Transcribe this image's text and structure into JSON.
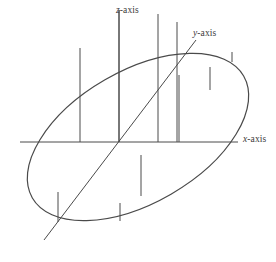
{
  "figure": {
    "kind": "3d-axes-ellipse-diagram",
    "width": 276,
    "height": 262,
    "background_color": "#ffffff",
    "stroke_color": "#4a4a4a",
    "stroke_color_dark": "#3f3f3f",
    "stroke_width": 1.0,
    "ellipse_stroke_width": 1.2
  },
  "labels": {
    "z_axis": {
      "var": "z",
      "suffix": "-axis",
      "x": 116,
      "y": 6
    },
    "y_axis": {
      "var": "y",
      "suffix": "-axis",
      "x": 193,
      "y": 29
    },
    "x_axis": {
      "var": "x",
      "suffix": "-axis",
      "x": 243,
      "y": 135
    }
  },
  "chart_data": {
    "type": "scatter",
    "title": "",
    "subtitle": "",
    "xlabel": "x-axis",
    "ylabel": "y-axis",
    "zlabel": "z-axis",
    "grid": false,
    "legend": null,
    "annotations": [
      "x-axis",
      "y-axis",
      "z-axis"
    ],
    "origin": {
      "x": 119,
      "y": 142
    },
    "ellipse": {
      "center_x": 138,
      "center_y": 137,
      "semi_major": 122,
      "semi_minor": 66,
      "rotation_deg": -30
    },
    "axes": [
      {
        "name": "x-axis",
        "type": "line",
        "x1": 20,
        "y1": 142,
        "x2": 238,
        "y2": 142
      },
      {
        "name": "y-axis",
        "type": "line",
        "x1": 44,
        "y1": 240,
        "x2": 196,
        "y2": 40
      },
      {
        "name": "z-axis",
        "type": "line",
        "x1": 119,
        "y1": 10,
        "x2": 119,
        "y2": 142
      }
    ],
    "ordinates": [
      {
        "x": 80,
        "y_top": 48,
        "y_bottom": 142
      },
      {
        "x": 119,
        "y_top": 10,
        "y_bottom": 142
      },
      {
        "x": 158,
        "y_top": 14,
        "y_bottom": 142
      },
      {
        "x": 177,
        "y_top": 22,
        "y_bottom": 142
      },
      {
        "x": 179,
        "y_top": 75,
        "y_bottom": 142
      },
      {
        "x": 210,
        "y_top": 67,
        "y_bottom": 90
      },
      {
        "x": 232,
        "y_top": 52,
        "y_bottom": 62
      },
      {
        "x": 141,
        "y_top": 155,
        "y_bottom": 196
      },
      {
        "x": 120,
        "y_top": 203,
        "y_bottom": 221
      },
      {
        "x": 58,
        "y_top": 192,
        "y_bottom": 222
      }
    ]
  }
}
